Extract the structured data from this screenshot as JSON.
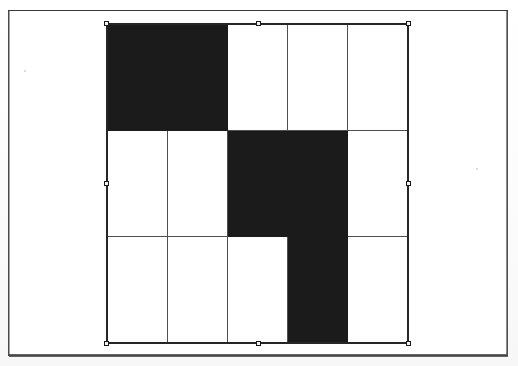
{
  "document": {
    "title": "Scanned figure page",
    "frame_color": "#3a3a3a",
    "background_color": "#ffffff"
  },
  "selection": {
    "state": "selected",
    "outline_color": "#262626",
    "handle_fill": "#f2f2f2",
    "handle_border": "#1a1a1a",
    "handles": [
      {
        "name": "handle-top-left",
        "position": "nw"
      },
      {
        "name": "handle-top-center",
        "position": "n"
      },
      {
        "name": "handle-top-right",
        "position": "ne"
      },
      {
        "name": "handle-middle-left",
        "position": "w"
      },
      {
        "name": "handle-middle-right",
        "position": "e"
      },
      {
        "name": "handle-bottom-left",
        "position": "sw"
      },
      {
        "name": "handle-bottom-center",
        "position": "s"
      },
      {
        "name": "handle-bottom-right",
        "position": "se"
      }
    ]
  },
  "chart_data": {
    "type": "heatmap",
    "title": "",
    "subtitle": "",
    "xlabel": "",
    "ylabel": "",
    "rows": 3,
    "cols": 5,
    "grid_on": true,
    "legend": "none",
    "fill_color": "#1b1b1b",
    "empty_color": "#ffffff",
    "line_color": "#4f4f4f",
    "row_labels": [
      "row-1",
      "row-2",
      "row-3"
    ],
    "col_labels": [
      "col-1",
      "col-2",
      "col-3",
      "col-4",
      "col-5"
    ],
    "values": [
      [
        1,
        1,
        0,
        0,
        0
      ],
      [
        0,
        0,
        1,
        1,
        0
      ],
      [
        0,
        0,
        0,
        1,
        0
      ]
    ],
    "filled_count": 5,
    "total_cells": 15
  },
  "geometry": {
    "grid_left": 107,
    "grid_top": 24,
    "grid_width": 301,
    "grid_height": 319,
    "frame_left": 8,
    "frame_top": 10,
    "frame_width": 500,
    "frame_height": 346
  }
}
